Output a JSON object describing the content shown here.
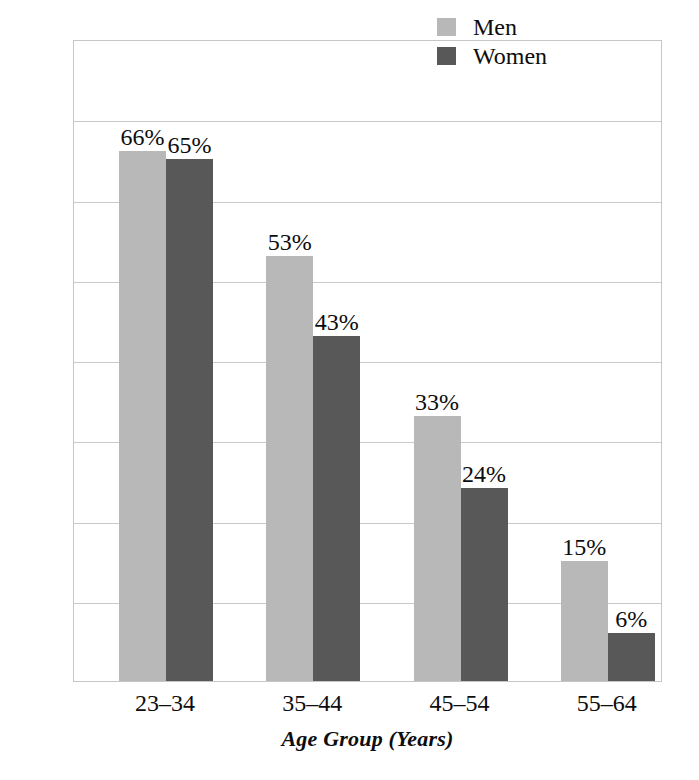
{
  "chart_data": {
    "type": "bar",
    "title": "",
    "subtitle": "",
    "xlabel": "Age Group (Years)",
    "ylabel": "Percentage Who Cohabitated Before Marriage",
    "categories": [
      "23–34",
      "35–44",
      "45–54",
      "55–64"
    ],
    "series": [
      {
        "name": "Men",
        "color": "#b8b8b8",
        "values": [
          66,
          53,
          33,
          15
        ],
        "labels": [
          "66%",
          "53%",
          "33%",
          "15%"
        ]
      },
      {
        "name": "Women",
        "color": "#585858",
        "values": [
          65,
          43,
          24,
          6
        ],
        "labels": [
          "65%",
          "43%",
          "24%",
          "6%"
        ]
      }
    ],
    "ylim": [
      0,
      80
    ],
    "ytick_values": [
      0,
      10,
      20,
      30,
      40,
      50,
      60,
      70,
      80
    ],
    "ytick_labels_shown": false,
    "grid": true,
    "grid_orientation": "horizontal",
    "legend_position": "top-right",
    "value_labels_shown": true,
    "value_label_suffix": "%"
  },
  "legend": {
    "items": [
      {
        "label": "Men",
        "swatch": "legend-swatch-men"
      },
      {
        "label": "Women",
        "swatch": "legend-swatch-women"
      }
    ]
  },
  "axes": {
    "y_title": "Percentage Who Cohabitated Before Marriage",
    "x_title": "Age Group (Years)",
    "x_ticks": [
      "23–34",
      "35–44",
      "45–54",
      "55–64"
    ]
  },
  "values": {
    "men": [
      "66%",
      "53%",
      "33%",
      "15%"
    ],
    "women": [
      "65%",
      "43%",
      "24%",
      "6%"
    ]
  },
  "colors": {
    "men": "#b8b8b8",
    "women": "#585858",
    "grid": "#c9c9c9",
    "frame": "#c6c6c6",
    "background": "#ffffff",
    "text": "#0d0d0d"
  }
}
